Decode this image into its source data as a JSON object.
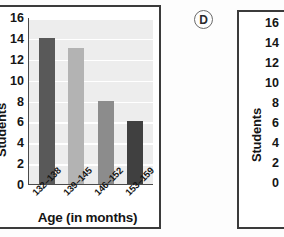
{
  "option_marker": {
    "label": "D"
  },
  "chart_data": {
    "type": "bar",
    "title": "",
    "xlabel": "Age (in months)",
    "ylabel": "Students",
    "categories": [
      "132–138",
      "139–145",
      "146–152",
      "153–159"
    ],
    "values": [
      14,
      13,
      8,
      6
    ],
    "bar_colors": [
      "#595959",
      "#b3b3b3",
      "#8c8c8c",
      "#404040"
    ],
    "ylim": [
      0,
      16
    ],
    "yticks": [
      16,
      14,
      12,
      10,
      8,
      6,
      4,
      2,
      0
    ],
    "grid": true,
    "legend": "none",
    "plot_background": "#ededed",
    "gridline_color": "#ffffff"
  },
  "right_chart": {
    "ylabel": "Students",
    "yticks": [
      16,
      14,
      12,
      10,
      8,
      6,
      4,
      2,
      0
    ],
    "first_category_partial": "13"
  }
}
